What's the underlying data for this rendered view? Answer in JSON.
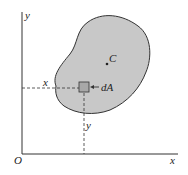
{
  "diagram": {
    "axes": {
      "x_label": "x",
      "y_label": "y",
      "origin_label": "O"
    },
    "region": {
      "fill_color": "#c8c8c8",
      "stroke_color": "#333333"
    },
    "centroid_label": "C",
    "element_label": "dA",
    "distance_labels": {
      "horizontal": "x",
      "vertical": "y"
    }
  }
}
